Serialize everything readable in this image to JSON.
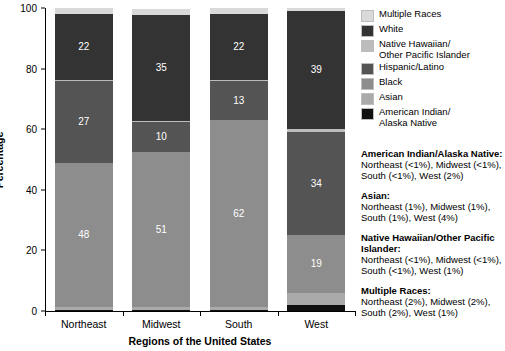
{
  "chart_data": {
    "type": "bar",
    "subtype": "stacked-bar-100",
    "title": "",
    "xlabel": "Regions of the United States",
    "ylabel": "Percentage",
    "categories": [
      "Northeast",
      "Midwest",
      "South",
      "West"
    ],
    "ylim": [
      0,
      100
    ],
    "yticks": [
      0,
      20,
      40,
      60,
      80,
      100
    ],
    "grid": false,
    "legend_position": "right",
    "series": [
      {
        "name": "American Indian/Alaska Native",
        "color": "#111111",
        "values": [
          0.4,
          0.4,
          0.4,
          2
        ],
        "labels": [
          "",
          "",
          "",
          ""
        ]
      },
      {
        "name": "Asian",
        "color": "#aaaaaa",
        "values": [
          1,
          1,
          1,
          4
        ],
        "labels": [
          "",
          "",
          "",
          ""
        ]
      },
      {
        "name": "Black",
        "color": "#8d8d8d",
        "values": [
          48,
          51,
          62,
          19
        ],
        "labels": [
          "48",
          "51",
          "62",
          "19"
        ]
      },
      {
        "name": "Hispanic/Latino",
        "color": "#545454",
        "values": [
          27,
          10,
          13,
          34
        ],
        "labels": [
          "27",
          "10",
          "13",
          "34"
        ]
      },
      {
        "name": "Native Hawaiian/Other Pacific Islander",
        "color": "#bcbcbc",
        "values": [
          0.4,
          0.4,
          0.4,
          1
        ],
        "labels": [
          "",
          "",
          "",
          ""
        ]
      },
      {
        "name": "White",
        "color": "#333333",
        "values": [
          22,
          35,
          22,
          39
        ],
        "labels": [
          "22",
          "35",
          "22",
          "39"
        ]
      },
      {
        "name": "Multiple Races",
        "color": "#d9d9d9",
        "values": [
          2,
          2,
          2,
          1
        ],
        "labels": [
          "",
          "",
          "",
          ""
        ]
      }
    ]
  },
  "axes": {
    "y_title": "Percentage",
    "x_title": "Regions of the United States",
    "y_tick_labels": [
      "0",
      "20",
      "40",
      "60",
      "80",
      "100"
    ],
    "x_tick_labels": [
      "Northeast",
      "Midwest",
      "South",
      "West"
    ]
  },
  "legend": {
    "items": [
      {
        "label": "Multiple Races",
        "color": "#d9d9d9"
      },
      {
        "label": "White",
        "color": "#333333"
      },
      {
        "label": "Native Hawaiian/\nOther Pacific Islander",
        "color": "#bcbcbc"
      },
      {
        "label": "Hispanic/Latino",
        "color": "#545454"
      },
      {
        "label": "Black",
        "color": "#8d8d8d"
      },
      {
        "label": "Asian",
        "color": "#aaaaaa"
      },
      {
        "label": "American Indian/\nAlaska Native",
        "color": "#111111"
      }
    ]
  },
  "footnotes": [
    {
      "title": "American Indian/Alaska Native:",
      "body": "Northeast (<1%), Midwest (<1%), South (<1%), West (2%)"
    },
    {
      "title": "Asian:",
      "body": "Northeast (1%), Midwest (1%), South (1%), West (4%)"
    },
    {
      "title": "Native Hawaiian/Other Pacific Islander:",
      "body": "Northeast (<1%), Midwest (<1%), South (<1%), West (1%)"
    },
    {
      "title": "Multiple Races:",
      "body": "Northeast (2%), Midwest (2%), South (2%), West (1%)"
    }
  ]
}
